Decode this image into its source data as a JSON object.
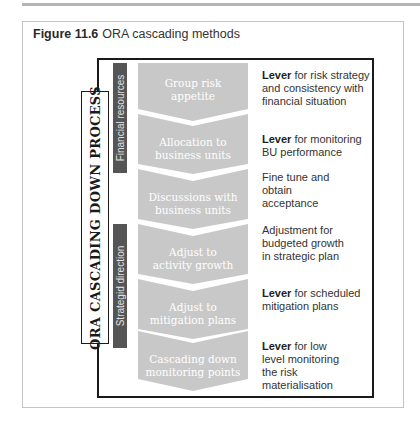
{
  "figure": {
    "number": "Figure 11.6",
    "title": "ORA cascading methods"
  },
  "diagram": {
    "process_label": "ORA CASCADING DOWN PROCESS",
    "groups": [
      {
        "label": "Financial resources"
      },
      {
        "label": "Strategid direction"
      }
    ],
    "steps": [
      {
        "line1": "Group risk",
        "line2": "appetite",
        "desc_bold": "Lever",
        "desc_rest": " for risk strategy and consistency with financial situation"
      },
      {
        "line1": "Allocation to",
        "line2": "business units",
        "desc_bold": "Lever",
        "desc_rest": " for monitoring BU performance"
      },
      {
        "line1": "Discussions with",
        "line2": "business units",
        "desc_bold": "",
        "desc_rest": "Fine tune and obtain acceptance"
      },
      {
        "line1": "Adjust to",
        "line2": "activity growth",
        "desc_bold": "",
        "desc_rest": "Adjustment for budgeted growth in strategic plan"
      },
      {
        "line1": "Adjust to",
        "line2": "mitigation plans",
        "desc_bold": "Lever",
        "desc_rest": " for scheduled mitigation plans"
      },
      {
        "line1": "Cascading down",
        "line2": "monitoring points",
        "desc_bold": "Lever",
        "desc_rest": " for low level monitoring the risk materialisation"
      }
    ],
    "colors": {
      "chevron_fill": "#c8c8c8",
      "group_bar": "#555555",
      "frame": "#1a1a1a"
    }
  }
}
